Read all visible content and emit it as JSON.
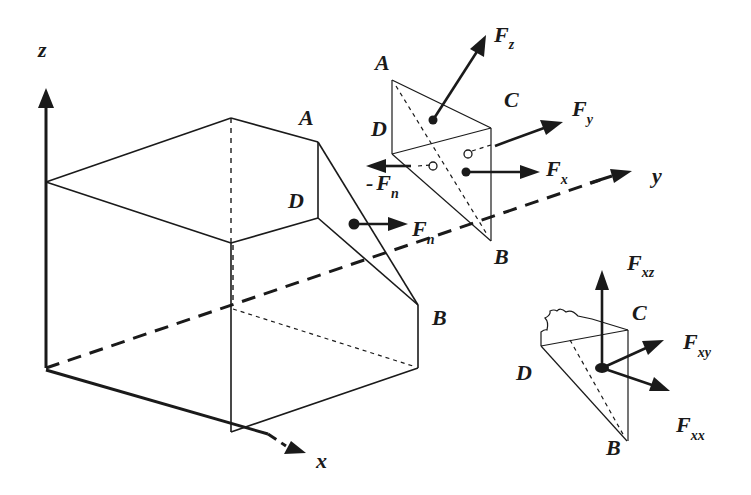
{
  "figure": {
    "background": "#ffffff",
    "ink": "#1a1a1a"
  },
  "axes": {
    "z": "z",
    "y": "y",
    "x": "x"
  },
  "cube": {
    "vertex_A": "A",
    "vertex_D": "D",
    "vertex_B": "B",
    "force_label_main": "F",
    "force_label_sub": "n"
  },
  "tetrahedron": {
    "vertex_A": "A",
    "vertex_C": "C",
    "vertex_D": "D",
    "vertex_B": "B",
    "fz": {
      "main": "F",
      "sub": "z"
    },
    "fy": {
      "main": "F",
      "sub": "y"
    },
    "fx": {
      "main": "F",
      "sub": "x"
    },
    "neg_fn": {
      "prefix": "-",
      "main": "F",
      "sub": "n"
    }
  },
  "detail": {
    "vertex_C": "C",
    "vertex_D": "D",
    "vertex_B": "B",
    "fxz": {
      "main": "F",
      "sub": "xz"
    },
    "fxy": {
      "main": "F",
      "sub": "xy"
    },
    "fxx": {
      "main": "F",
      "sub": "xx"
    }
  }
}
